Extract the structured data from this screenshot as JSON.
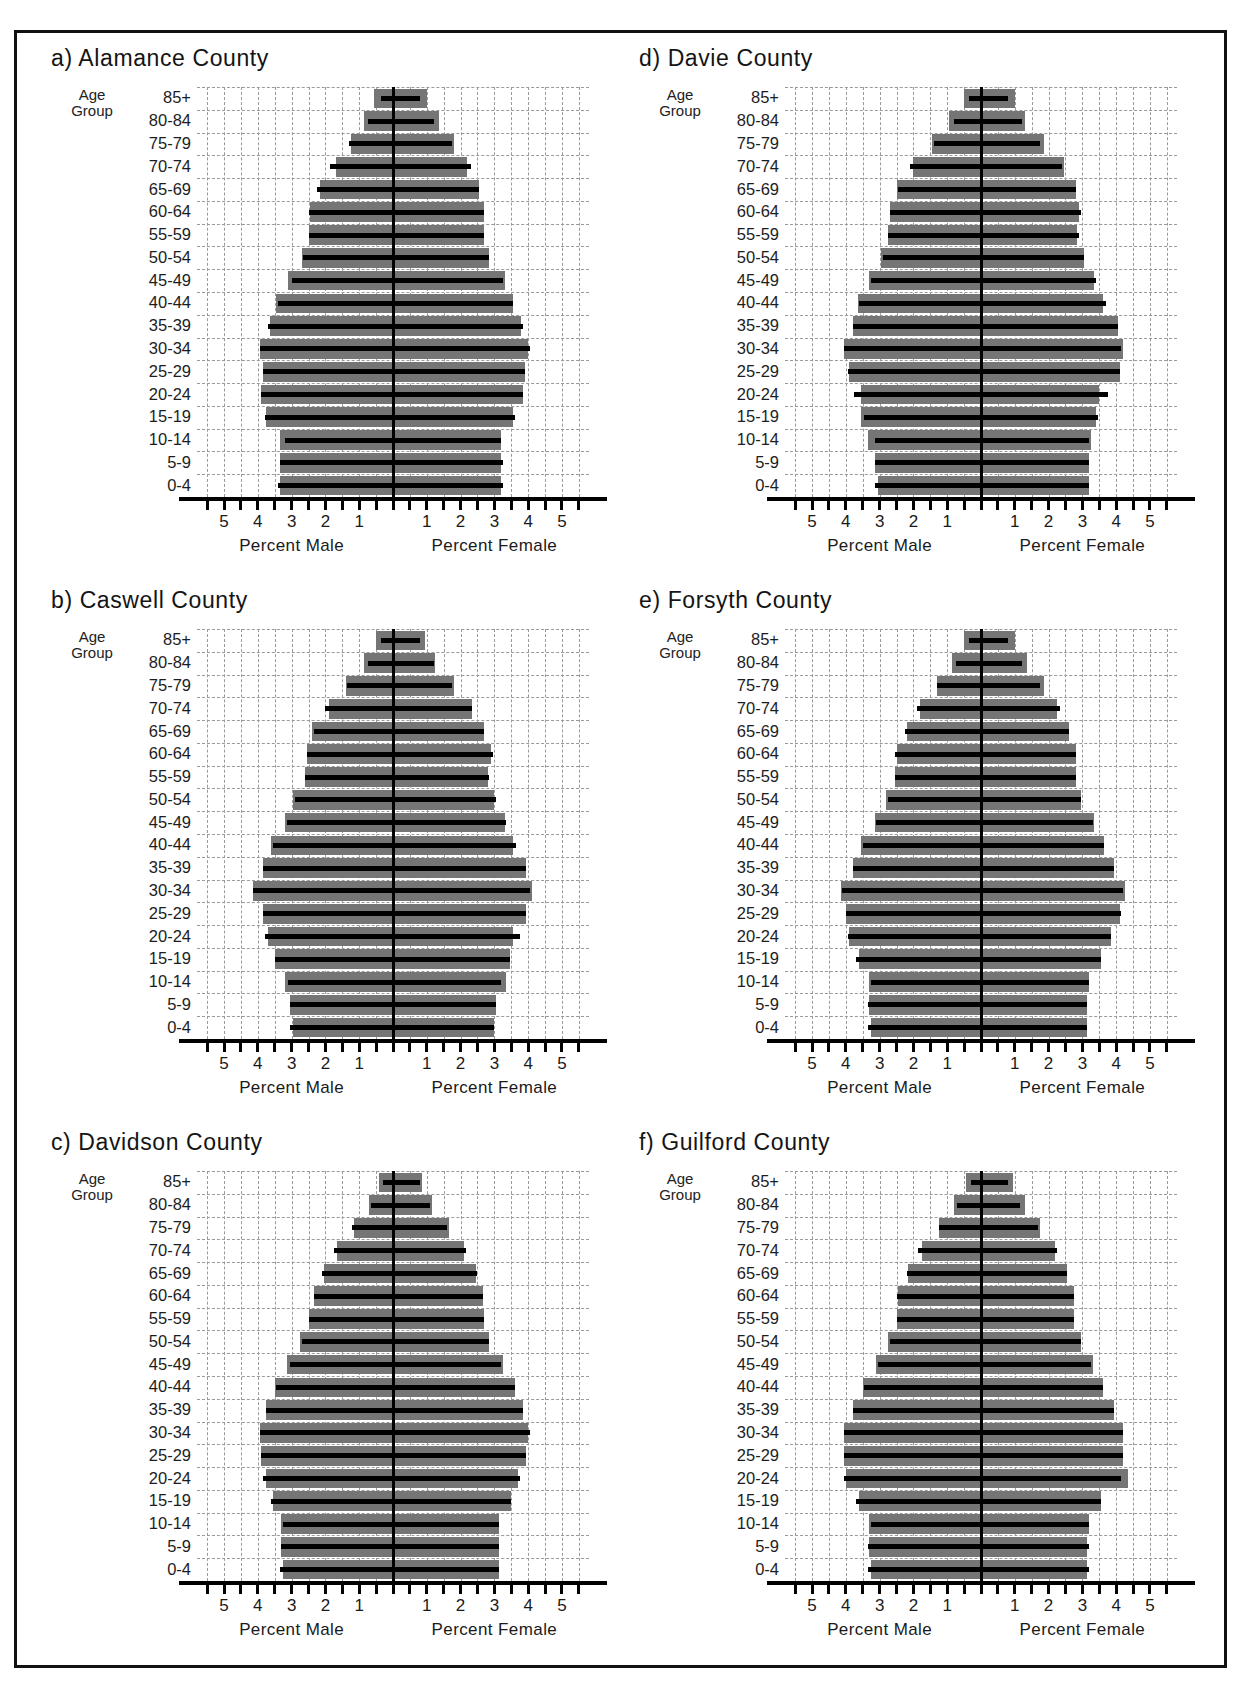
{
  "figure": {
    "age_group_caption_line1": "Age",
    "age_group_caption_line2": "Group",
    "xlabel_male": "Percent Male",
    "xlabel_female": "Percent Female",
    "x_tick_labels_male": [
      "5",
      "4",
      "3",
      "2",
      "1"
    ],
    "x_tick_labels_female": [
      "1",
      "2",
      "3",
      "4",
      "5"
    ],
    "age_groups": [
      "85+",
      "80-84",
      "75-79",
      "70-74",
      "65-69",
      "60-64",
      "55-59",
      "50-54",
      "45-49",
      "40-44",
      "35-39",
      "30-34",
      "25-29",
      "20-24",
      "15-19",
      "10-14",
      "5-9",
      "0-4"
    ],
    "colors": {
      "bar_fill": "#757575",
      "reference_line": "#000000",
      "grid": "#9a9a9a",
      "axis": "#000000",
      "frame": "#111111"
    }
  },
  "chart_data": [
    {
      "type": "bar",
      "panel": "a",
      "title": "a) Alamance County",
      "xlabel": "Percent Male | Percent Female",
      "ylabel": "Age Group",
      "categories": [
        "85+",
        "80-84",
        "75-79",
        "70-74",
        "65-69",
        "60-64",
        "55-59",
        "50-54",
        "45-49",
        "40-44",
        "35-39",
        "30-34",
        "25-29",
        "20-24",
        "15-19",
        "10-14",
        "5-9",
        "0-4"
      ],
      "xlim": [
        -5.8,
        5.8
      ],
      "grid": true,
      "series": [
        {
          "name": "Male",
          "values": [
            0.55,
            0.85,
            1.25,
            1.7,
            2.15,
            2.45,
            2.5,
            2.7,
            3.1,
            3.45,
            3.65,
            3.95,
            3.85,
            3.9,
            3.75,
            3.35,
            3.35,
            3.35
          ]
        },
        {
          "name": "Female",
          "values": [
            1.0,
            1.35,
            1.8,
            2.2,
            2.55,
            2.7,
            2.7,
            2.85,
            3.3,
            3.55,
            3.8,
            4.0,
            3.9,
            3.85,
            3.55,
            3.2,
            3.2,
            3.2
          ]
        },
        {
          "name": "Male reference (2000)",
          "values": [
            0.35,
            0.75,
            1.3,
            1.85,
            2.25,
            2.5,
            2.5,
            2.65,
            3.0,
            3.4,
            3.7,
            3.95,
            3.85,
            3.9,
            3.8,
            3.2,
            3.35,
            3.4
          ]
        },
        {
          "name": "Female reference (2000)",
          "values": [
            0.8,
            1.2,
            1.75,
            2.3,
            2.55,
            2.7,
            2.7,
            2.85,
            3.25,
            3.55,
            3.85,
            4.05,
            3.9,
            3.85,
            3.6,
            3.2,
            3.25,
            3.25
          ]
        }
      ]
    },
    {
      "type": "bar",
      "panel": "b",
      "title": "b) Caswell County",
      "xlabel": "Percent Male | Percent Female",
      "ylabel": "Age Group",
      "categories": [
        "85+",
        "80-84",
        "75-79",
        "70-74",
        "65-69",
        "60-64",
        "55-59",
        "50-54",
        "45-49",
        "40-44",
        "35-39",
        "30-34",
        "25-29",
        "20-24",
        "15-19",
        "10-14",
        "5-9",
        "0-4"
      ],
      "xlim": [
        -5.8,
        5.8
      ],
      "grid": true,
      "series": [
        {
          "name": "Male",
          "values": [
            0.5,
            0.85,
            1.4,
            1.9,
            2.4,
            2.55,
            2.6,
            2.95,
            3.2,
            3.6,
            3.85,
            4.15,
            3.85,
            3.7,
            3.5,
            3.2,
            3.05,
            2.95
          ]
        },
        {
          "name": "Female",
          "values": [
            0.95,
            1.25,
            1.8,
            2.35,
            2.7,
            2.9,
            2.8,
            3.0,
            3.3,
            3.55,
            3.95,
            4.1,
            3.95,
            3.55,
            3.45,
            3.35,
            3.05,
            3.0
          ]
        },
        {
          "name": "Male reference (2000)",
          "values": [
            0.35,
            0.75,
            1.35,
            2.0,
            2.35,
            2.55,
            2.6,
            2.9,
            3.15,
            3.55,
            3.85,
            4.15,
            3.85,
            3.8,
            3.5,
            3.1,
            3.05,
            3.05
          ]
        },
        {
          "name": "Female reference (2000)",
          "values": [
            0.8,
            1.2,
            1.75,
            2.35,
            2.7,
            2.95,
            2.85,
            3.05,
            3.35,
            3.65,
            3.95,
            4.05,
            3.95,
            3.75,
            3.45,
            3.2,
            3.05,
            3.0
          ]
        }
      ]
    },
    {
      "type": "bar",
      "panel": "c",
      "title": "c) Davidson County",
      "xlabel": "Percent Male | Percent Female",
      "ylabel": "Age Group",
      "categories": [
        "85+",
        "80-84",
        "75-79",
        "70-74",
        "65-69",
        "60-64",
        "55-59",
        "50-54",
        "45-49",
        "40-44",
        "35-39",
        "30-34",
        "25-29",
        "20-24",
        "15-19",
        "10-14",
        "5-9",
        "0-4"
      ],
      "xlim": [
        -5.8,
        5.8
      ],
      "grid": true,
      "series": [
        {
          "name": "Male",
          "values": [
            0.4,
            0.7,
            1.15,
            1.65,
            2.05,
            2.35,
            2.5,
            2.75,
            3.15,
            3.5,
            3.75,
            3.95,
            3.9,
            3.75,
            3.55,
            3.3,
            3.3,
            3.25
          ]
        },
        {
          "name": "Female",
          "values": [
            0.85,
            1.15,
            1.65,
            2.1,
            2.45,
            2.65,
            2.7,
            2.85,
            3.25,
            3.6,
            3.85,
            4.0,
            3.95,
            3.7,
            3.5,
            3.15,
            3.15,
            3.15
          ]
        },
        {
          "name": "Male reference (2000)",
          "values": [
            0.3,
            0.65,
            1.2,
            1.75,
            2.1,
            2.35,
            2.5,
            2.7,
            3.05,
            3.45,
            3.75,
            3.95,
            3.9,
            3.85,
            3.6,
            3.25,
            3.3,
            3.35
          ]
        },
        {
          "name": "Female reference (2000)",
          "values": [
            0.8,
            1.1,
            1.6,
            2.15,
            2.5,
            2.65,
            2.7,
            2.85,
            3.2,
            3.6,
            3.85,
            4.05,
            3.95,
            3.75,
            3.5,
            3.15,
            3.15,
            3.15
          ]
        }
      ]
    },
    {
      "type": "bar",
      "panel": "d",
      "title": "d) Davie County",
      "xlabel": "Percent Male | Percent Female",
      "ylabel": "Age Group",
      "categories": [
        "85+",
        "80-84",
        "75-79",
        "70-74",
        "65-69",
        "60-64",
        "55-59",
        "50-54",
        "45-49",
        "40-44",
        "35-39",
        "30-34",
        "25-29",
        "20-24",
        "15-19",
        "10-14",
        "5-9",
        "0-4"
      ],
      "xlim": [
        -5.8,
        5.8
      ],
      "grid": true,
      "series": [
        {
          "name": "Male",
          "values": [
            0.5,
            0.95,
            1.45,
            2.0,
            2.5,
            2.7,
            2.75,
            2.95,
            3.3,
            3.65,
            3.8,
            4.05,
            3.9,
            3.55,
            3.55,
            3.35,
            3.15,
            3.05
          ]
        },
        {
          "name": "Female",
          "values": [
            1.0,
            1.3,
            1.85,
            2.45,
            2.8,
            2.9,
            2.85,
            3.05,
            3.35,
            3.6,
            4.05,
            4.2,
            4.1,
            3.5,
            3.4,
            3.25,
            3.2,
            3.2
          ]
        },
        {
          "name": "Male reference (2000)",
          "values": [
            0.35,
            0.8,
            1.4,
            2.1,
            2.45,
            2.7,
            2.75,
            2.9,
            3.25,
            3.6,
            3.8,
            4.05,
            3.95,
            3.75,
            3.45,
            3.15,
            3.15,
            3.15
          ]
        },
        {
          "name": "Female reference (2000)",
          "values": [
            0.8,
            1.2,
            1.75,
            2.4,
            2.8,
            2.95,
            2.9,
            3.05,
            3.4,
            3.7,
            4.05,
            4.15,
            4.1,
            3.75,
            3.45,
            3.2,
            3.2,
            3.2
          ]
        }
      ]
    },
    {
      "type": "bar",
      "panel": "e",
      "title": "e) Forsyth County",
      "xlabel": "Percent Male | Percent Female",
      "ylabel": "Age Group",
      "categories": [
        "85+",
        "80-84",
        "75-79",
        "70-74",
        "65-69",
        "60-64",
        "55-59",
        "50-54",
        "45-49",
        "40-44",
        "35-39",
        "30-34",
        "25-29",
        "20-24",
        "15-19",
        "10-14",
        "5-9",
        "0-4"
      ],
      "xlim": [
        -5.8,
        5.8
      ],
      "grid": true,
      "series": [
        {
          "name": "Male",
          "values": [
            0.5,
            0.85,
            1.3,
            1.8,
            2.2,
            2.5,
            2.55,
            2.8,
            3.15,
            3.55,
            3.8,
            4.15,
            4.0,
            3.9,
            3.6,
            3.3,
            3.3,
            3.25
          ]
        },
        {
          "name": "Female",
          "values": [
            1.0,
            1.35,
            1.85,
            2.25,
            2.6,
            2.8,
            2.8,
            2.95,
            3.35,
            3.65,
            3.95,
            4.25,
            4.1,
            3.85,
            3.55,
            3.2,
            3.15,
            3.15
          ]
        },
        {
          "name": "Male reference (2000)",
          "values": [
            0.35,
            0.75,
            1.3,
            1.9,
            2.25,
            2.55,
            2.55,
            2.75,
            3.1,
            3.5,
            3.8,
            4.1,
            4.0,
            3.95,
            3.7,
            3.25,
            3.35,
            3.35
          ]
        },
        {
          "name": "Female reference (2000)",
          "values": [
            0.8,
            1.2,
            1.75,
            2.35,
            2.6,
            2.8,
            2.8,
            2.95,
            3.3,
            3.65,
            3.95,
            4.2,
            4.15,
            3.85,
            3.55,
            3.2,
            3.15,
            3.15
          ]
        }
      ]
    },
    {
      "type": "bar",
      "panel": "f",
      "title": "f) Guilford County",
      "xlabel": "Percent Male | Percent Female",
      "ylabel": "Age Group",
      "categories": [
        "85+",
        "80-84",
        "75-79",
        "70-74",
        "65-69",
        "60-64",
        "55-59",
        "50-54",
        "45-49",
        "40-44",
        "35-39",
        "30-34",
        "25-29",
        "20-24",
        "15-19",
        "10-14",
        "5-9",
        "0-4"
      ],
      "xlim": [
        -5.8,
        5.8
      ],
      "grid": true,
      "series": [
        {
          "name": "Male",
          "values": [
            0.45,
            0.8,
            1.25,
            1.75,
            2.15,
            2.45,
            2.5,
            2.75,
            3.1,
            3.5,
            3.8,
            4.05,
            4.05,
            4.0,
            3.6,
            3.3,
            3.3,
            3.25
          ]
        },
        {
          "name": "Female",
          "values": [
            0.95,
            1.3,
            1.75,
            2.2,
            2.55,
            2.75,
            2.75,
            2.95,
            3.3,
            3.6,
            3.95,
            4.2,
            4.2,
            4.35,
            3.55,
            3.2,
            3.15,
            3.15
          ]
        },
        {
          "name": "Male reference (2000)",
          "values": [
            0.3,
            0.7,
            1.25,
            1.85,
            2.2,
            2.5,
            2.5,
            2.7,
            3.05,
            3.45,
            3.8,
            4.05,
            4.05,
            4.05,
            3.7,
            3.25,
            3.35,
            3.35
          ]
        },
        {
          "name": "Female reference (2000)",
          "values": [
            0.8,
            1.15,
            1.7,
            2.25,
            2.55,
            2.75,
            2.75,
            2.95,
            3.25,
            3.6,
            3.95,
            4.2,
            4.2,
            4.15,
            3.55,
            3.2,
            3.2,
            3.2
          ]
        }
      ]
    }
  ]
}
